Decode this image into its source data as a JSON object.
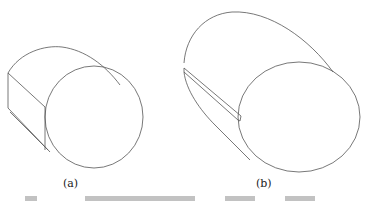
{
  "figure": {
    "panels": [
      {
        "id": "a",
        "label": "(a)",
        "description": "Cylinder with one flat cut face (D-shaped section)"
      },
      {
        "id": "b",
        "label": "(b)",
        "description": "Cylinder with a longitudinal groove/slot"
      }
    ],
    "caption_truncated": true,
    "stroke_color": "#555555",
    "background": "#ffffff"
  }
}
